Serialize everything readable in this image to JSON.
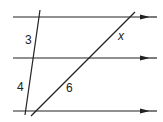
{
  "diagram": {
    "type": "parallel-lines-transversals",
    "parallel_lines": [
      {
        "id": "top",
        "y": 17,
        "x1": 13,
        "x2": 157,
        "arrow": true
      },
      {
        "id": "middle",
        "y": 58,
        "x1": 13,
        "x2": 157,
        "arrow": true
      },
      {
        "id": "bottom",
        "y": 111,
        "x1": 13,
        "x2": 157,
        "arrow": true
      }
    ],
    "transversals": [
      {
        "id": "left",
        "x1": 40,
        "y1": 10,
        "x2": 25,
        "y2": 115
      },
      {
        "id": "right",
        "x1": 135,
        "y1": 12,
        "x2": 31,
        "y2": 116
      }
    ],
    "labels": {
      "left_upper": "3",
      "left_lower": "4",
      "right_upper": "x",
      "right_lower": "6"
    },
    "colors": {
      "stroke": "#222222",
      "background": "#ffffff"
    }
  }
}
